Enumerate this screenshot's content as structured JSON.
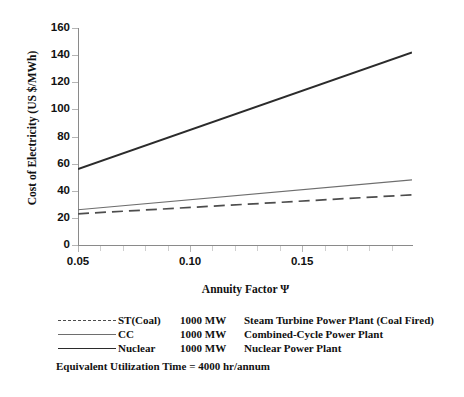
{
  "chart_data": {
    "type": "line",
    "title": "",
    "xlabel": "Annuity Factor Ψ",
    "ylabel": "Cost of Electricity  (US $/MWh)",
    "xlim": [
      0.05,
      0.199
    ],
    "ylim": [
      0,
      160
    ],
    "grid": false,
    "legend_position": "below-plot",
    "x_ticks": [
      0.05,
      0.1,
      0.15
    ],
    "x_tick_labels": [
      "0.05",
      "0.10",
      "0.15"
    ],
    "x_minor_ticks": [
      0.06,
      0.07,
      0.08,
      0.09,
      0.11,
      0.12,
      0.13,
      0.14,
      0.16,
      0.17,
      0.18,
      0.19
    ],
    "y_ticks": [
      0,
      20,
      40,
      60,
      80,
      100,
      120,
      140,
      160
    ],
    "y_tick_labels": [
      "0",
      "20",
      "40",
      "60",
      "80",
      "100",
      "120",
      "140",
      "160"
    ],
    "series": [
      {
        "name": "ST(Coal)",
        "style": "dashed",
        "color": "#4d4d4d",
        "x": [
          0.05,
          0.199
        ],
        "values": [
          23,
          37
        ]
      },
      {
        "name": "CC",
        "style": "solid-thin",
        "color": "#6e6e6e",
        "x": [
          0.05,
          0.199
        ],
        "values": [
          26,
          48
        ]
      },
      {
        "name": "Nuclear",
        "style": "solid-thick",
        "color": "#2b2b2b",
        "x": [
          0.05,
          0.199
        ],
        "values": [
          56,
          142
        ]
      }
    ],
    "annotations": [
      "Equivalent Utilization Time  = 4000 hr/annum"
    ]
  },
  "legend": {
    "rows": [
      {
        "name": "ST(Coal)",
        "capacity": "1000 MW",
        "description": "Steam Turbine Power Plant (Coal Fired)"
      },
      {
        "name": "CC",
        "capacity": "1000 MW",
        "description": "Combined-Cycle Power Plant"
      },
      {
        "name": "Nuclear",
        "capacity": "1000 MW",
        "description": "Nuclear Power Plant"
      }
    ],
    "note": "Equivalent Utilization Time  = 4000 hr/annum"
  }
}
